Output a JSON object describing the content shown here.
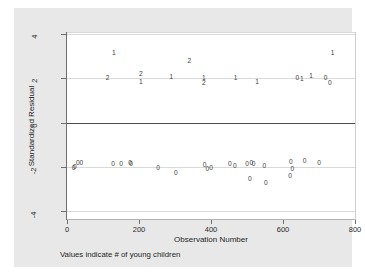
{
  "figure": {
    "footnote": "Values indicate # of young children",
    "canvas_color": "#e8e8e8",
    "panel_color": "#ffffff",
    "marker_color": "#3c3c3c",
    "zeroline_color": "#4a4a4a",
    "gridline_color": "#d9d9d9"
  },
  "chart_data": {
    "type": "scatter",
    "title": "",
    "subtitle": "",
    "annotation": "Values indicate # of young children",
    "xlabel": "Observation Number",
    "ylabel": "Standardized Residual",
    "xlim": [
      0,
      800
    ],
    "ylim": [
      -4,
      4
    ],
    "xticks": [
      0,
      200,
      400,
      600,
      800
    ],
    "yticks": [
      4,
      2,
      0,
      -2,
      -4
    ],
    "xtick_labels": [
      "0",
      "200",
      "400",
      "600",
      "800"
    ],
    "ytick_labels": [
      "4",
      "2",
      "0",
      "-2",
      "-4"
    ],
    "grid": true,
    "grid_axis": "y",
    "legend": "none",
    "reference_lines": [
      {
        "y": 0,
        "style": "solid",
        "color": "#4a4a4a"
      }
    ],
    "marker_style": "text-label",
    "marker_note": "Each plotted marker is the digit indicating the number of young children for that observation",
    "points": [
      {
        "x": 18,
        "y": -2.05,
        "label": "0"
      },
      {
        "x": 22,
        "y": -2.0,
        "label": "0"
      },
      {
        "x": 30,
        "y": -1.85,
        "label": "0"
      },
      {
        "x": 40,
        "y": -1.85,
        "label": "0"
      },
      {
        "x": 130,
        "y": 3.15,
        "label": "1"
      },
      {
        "x": 113,
        "y": 2.0,
        "label": "2"
      },
      {
        "x": 128,
        "y": -1.88,
        "label": "0"
      },
      {
        "x": 150,
        "y": -1.88,
        "label": "0"
      },
      {
        "x": 175,
        "y": -1.82,
        "label": "0"
      },
      {
        "x": 178,
        "y": -1.88,
        "label": "0"
      },
      {
        "x": 205,
        "y": 2.18,
        "label": "2"
      },
      {
        "x": 205,
        "y": 1.85,
        "label": "1"
      },
      {
        "x": 253,
        "y": -2.05,
        "label": "0"
      },
      {
        "x": 290,
        "y": 2.05,
        "label": "1"
      },
      {
        "x": 302,
        "y": -2.3,
        "label": "0"
      },
      {
        "x": 340,
        "y": 2.78,
        "label": "2"
      },
      {
        "x": 380,
        "y": 2.0,
        "label": "1"
      },
      {
        "x": 380,
        "y": 1.78,
        "label": "2"
      },
      {
        "x": 382,
        "y": -1.9,
        "label": "0"
      },
      {
        "x": 390,
        "y": -2.12,
        "label": "0"
      },
      {
        "x": 400,
        "y": -2.05,
        "label": "0"
      },
      {
        "x": 452,
        "y": -1.88,
        "label": "0"
      },
      {
        "x": 466,
        "y": -1.95,
        "label": "0"
      },
      {
        "x": 468,
        "y": 2.0,
        "label": "1"
      },
      {
        "x": 500,
        "y": -1.88,
        "label": "0"
      },
      {
        "x": 512,
        "y": -1.85,
        "label": "0"
      },
      {
        "x": 518,
        "y": -1.88,
        "label": "0"
      },
      {
        "x": 508,
        "y": -2.55,
        "label": "0"
      },
      {
        "x": 528,
        "y": 1.85,
        "label": "1"
      },
      {
        "x": 548,
        "y": -1.98,
        "label": "0"
      },
      {
        "x": 552,
        "y": -2.75,
        "label": "0"
      },
      {
        "x": 622,
        "y": -1.78,
        "label": "0"
      },
      {
        "x": 626,
        "y": -2.1,
        "label": "0"
      },
      {
        "x": 620,
        "y": -2.42,
        "label": "0"
      },
      {
        "x": 640,
        "y": 2.02,
        "label": "0"
      },
      {
        "x": 652,
        "y": 1.98,
        "label": "1"
      },
      {
        "x": 660,
        "y": -1.75,
        "label": "0"
      },
      {
        "x": 678,
        "y": 2.08,
        "label": "1"
      },
      {
        "x": 700,
        "y": -1.85,
        "label": "0"
      },
      {
        "x": 718,
        "y": 2.0,
        "label": "0"
      },
      {
        "x": 730,
        "y": 1.8,
        "label": "0"
      },
      {
        "x": 738,
        "y": 3.15,
        "label": "1"
      }
    ]
  }
}
